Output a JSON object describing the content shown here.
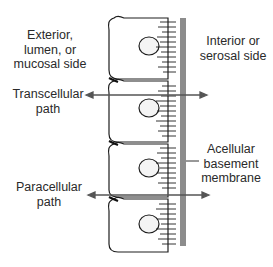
{
  "labels": {
    "exterior": [
      "Exterior,",
      "lumen, or",
      "mucosal side"
    ],
    "interior": [
      "Interior or",
      "serosal side"
    ],
    "transcellular": [
      "Transcellular",
      "path"
    ],
    "paracellular": [
      "Paracellular",
      "path"
    ],
    "basement": [
      "Acellular",
      "basement",
      "membrane"
    ]
  },
  "colors": {
    "line": "#1e1e1e",
    "membrane": "#8c8c8c",
    "arrow": "#555555",
    "text": "#2a2a2a"
  },
  "cells": {
    "count": 4
  }
}
